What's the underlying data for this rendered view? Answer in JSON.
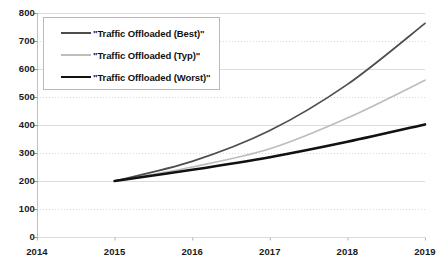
{
  "chart_data": {
    "type": "line",
    "title": "",
    "xlabel": "",
    "ylabel": "",
    "x": [
      2014,
      2015,
      2016,
      2017,
      2018,
      2019
    ],
    "categories": [
      "2014",
      "2015",
      "2016",
      "2017",
      "2018",
      "2019"
    ],
    "xlim": [
      2014,
      2019
    ],
    "ylim": [
      0,
      800
    ],
    "yticks": [
      0,
      100,
      200,
      300,
      400,
      500,
      600,
      700,
      800
    ],
    "ytick_labels": [
      "0",
      "100",
      "200",
      "300",
      "400",
      "500",
      "600",
      "700",
      "800"
    ],
    "grid": true,
    "grid_axis": "y",
    "grid_color": "#d9d9d9",
    "legend_position": "upper-left-inside",
    "series": [
      {
        "name": "\"Traffic Offloaded (Best)\"",
        "color": "#4d4d4d",
        "width": 1.7,
        "x": [
          2015,
          2016,
          2017,
          2018,
          2019
        ],
        "values": [
          200,
          270,
          380,
          545,
          763
        ]
      },
      {
        "name": "\"Traffic Offloaded (Typ)\"",
        "color": "#bdbdbd",
        "width": 1.7,
        "x": [
          2015,
          2016,
          2017,
          2018,
          2019
        ],
        "values": [
          200,
          250,
          315,
          425,
          560
        ]
      },
      {
        "name": "\"Traffic Offloaded (Worst)\"",
        "color": "#111111",
        "width": 2.6,
        "x": [
          2015,
          2016,
          2017,
          2018,
          2019
        ],
        "values": [
          200,
          240,
          285,
          340,
          402
        ]
      }
    ]
  },
  "legend": {
    "items": [
      {
        "label": "\"Traffic Offloaded (Best)\""
      },
      {
        "label": "\"Traffic Offloaded (Typ)\""
      },
      {
        "label": "\"Traffic Offloaded (Worst)\""
      }
    ]
  },
  "axes": {
    "y_ticks": [
      "800",
      "700",
      "600",
      "500",
      "400",
      "300",
      "200",
      "100",
      "0"
    ],
    "x_ticks": [
      "2014",
      "2015",
      "2016",
      "2017",
      "2018",
      "2019"
    ]
  }
}
